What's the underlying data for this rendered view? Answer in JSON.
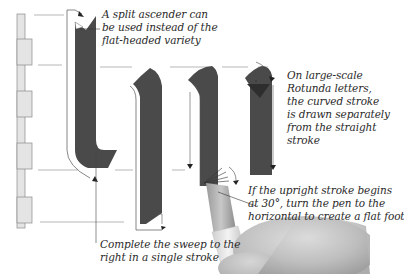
{
  "figure": {
    "colors": {
      "ink": "#4a4a4a",
      "ink_dark": "#333333",
      "ladder_fill": "#e4e4e4",
      "ladder_stroke": "#8a8a8a",
      "guide_line": "#9a9a9a",
      "arrow": "#222222",
      "text": "#2a2a2a"
    },
    "icons": {
      "pen": "calligraphy-pen",
      "hand": "hand",
      "arrow": "arrowhead"
    }
  },
  "annotations": {
    "split_ascender": {
      "lines": [
        "A split ascender can",
        "be used instead of the",
        "flat-headed variety"
      ]
    },
    "rotunda": {
      "lines": [
        "On large-scale",
        "Rotunda letters,",
        "the curved stroke",
        "is drawn separately",
        "from the straight",
        "stroke"
      ]
    },
    "upright": {
      "lines": [
        "If the upright stroke begins",
        "at 30°, turn the pen to the",
        "horizontal to create a flat foot"
      ]
    },
    "sweep": {
      "lines": [
        "Complete the sweep to the",
        "right in a single stroke"
      ]
    }
  }
}
